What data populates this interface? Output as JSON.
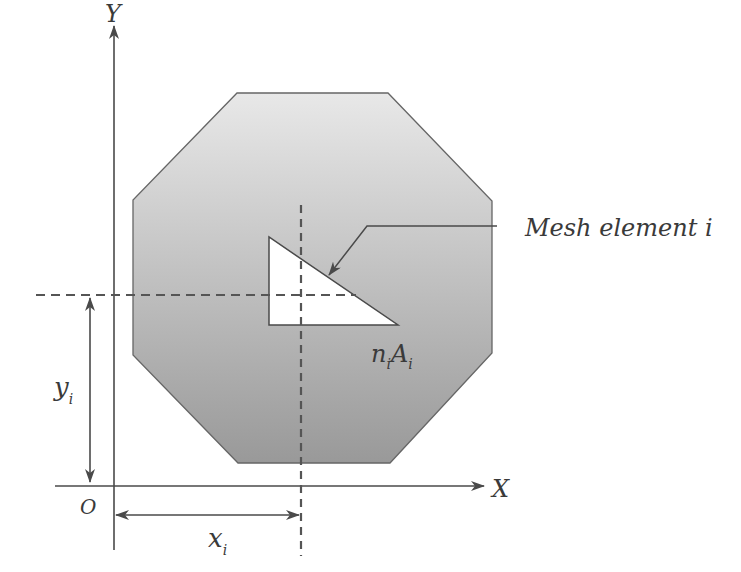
{
  "figure": {
    "type": "centroid-mesh-diagram",
    "colors": {
      "line": "#4a4a4a",
      "dashed": "#555555",
      "fill_top": "#e6e6e6",
      "fill_bottom": "#9a9a9a",
      "element_fill": "#ffffff",
      "text": "#3a3a3a"
    },
    "axes": {
      "y_label": "Y",
      "x_label": "X",
      "origin_label": "O"
    },
    "labels": {
      "mesh_element": "Mesh element i",
      "element_area_n": "n",
      "element_area_n_sub": "i",
      "element_area_A": "A",
      "element_area_A_sub": "i",
      "x_dim": "x",
      "x_dim_sub": "i",
      "y_dim": "y",
      "y_dim_sub": "i"
    },
    "shapes": {
      "octagon": "237,93 388,93 492,201 492,353 390,463 238,463 133,355 133,200",
      "element_triangle": "269,237 269,325 398,325"
    }
  }
}
